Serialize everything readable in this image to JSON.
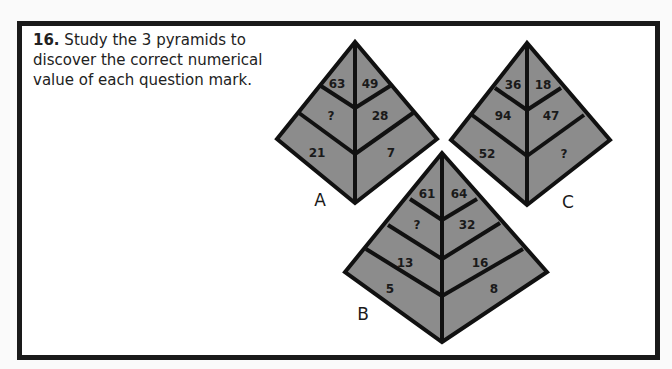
{
  "question": {
    "number": "16.",
    "text": "Study the 3 pyramids to discover the correct numerical value of each question mark."
  },
  "colors": {
    "fill": "#8c8c8c",
    "stroke": "#111111",
    "frame": "#1a1a1a"
  },
  "pyramids": {
    "A": {
      "label": "A",
      "cells": {
        "top_left": "63",
        "top_right": "49",
        "mid_left": "?",
        "mid_right": "28",
        "bot_left": "21",
        "bot_right": "7"
      }
    },
    "B": {
      "label": "B",
      "cells": {
        "r1_left": "61",
        "r1_right": "64",
        "r2_left": "?",
        "r2_right": "32",
        "r3_left": "13",
        "r3_right": "16",
        "r4_left": "5",
        "r4_right": "8"
      }
    },
    "C": {
      "label": "C",
      "cells": {
        "top_left": "36",
        "top_right": "18",
        "mid_left": "94",
        "mid_right": "47",
        "bot_left": "52",
        "bot_right": "?"
      }
    }
  }
}
